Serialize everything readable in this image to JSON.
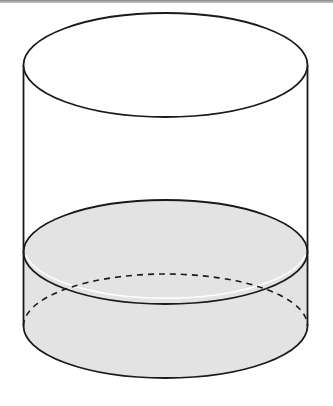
{
  "diagram": {
    "colors": {
      "background": "#ffffff",
      "outline": "#1a1a1a",
      "liquid_fill": "#e3e3e3",
      "top_bar": "#9a9a9a"
    },
    "geometry": {
      "center_x": 165.5,
      "radius_x": 142,
      "radius_y": 52,
      "top_ellipse_cy": 65,
      "liquid_surface_cy": 252,
      "bottom_ellipse_cy": 326
    },
    "parts": [
      {
        "name": "top-rim",
        "style": "solid"
      },
      {
        "name": "side-walls",
        "style": "solid"
      },
      {
        "name": "liquid-surface",
        "style": "solid",
        "filled": true
      },
      {
        "name": "bottom-back-edge",
        "style": "dashed"
      },
      {
        "name": "bottom-front-edge",
        "style": "solid"
      }
    ]
  }
}
